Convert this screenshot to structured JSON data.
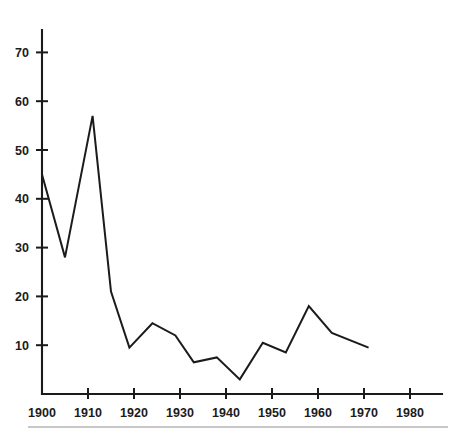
{
  "chart_data": {
    "type": "line",
    "title": "",
    "subtitle": "",
    "xlabel": "",
    "ylabel": "",
    "xlim": [
      1900,
      1980
    ],
    "ylim": [
      0,
      77
    ],
    "grid": false,
    "legend": null,
    "xticks": [
      "1900",
      "1910",
      "1920",
      "1930",
      "1940",
      "1950",
      "1960",
      "1970",
      "1980"
    ],
    "xtick_values": [
      1900,
      1910,
      1920,
      1930,
      1940,
      1950,
      1960,
      1970,
      1980
    ],
    "yticks": [
      "10",
      "20",
      "30",
      "40",
      "50",
      "60",
      "70"
    ],
    "ytick_values": [
      10,
      20,
      30,
      40,
      50,
      60,
      70
    ],
    "series": [
      {
        "name": "series-1",
        "color": "#1b1b1b",
        "x": [
          1900,
          1905,
          1911,
          1915,
          1919,
          1924,
          1929,
          1933,
          1938,
          1943,
          1948,
          1953,
          1958,
          1963,
          1971
        ],
        "values": [
          45,
          28,
          57,
          21,
          9.5,
          14.5,
          12,
          6.5,
          7.5,
          3,
          10.5,
          8.5,
          18,
          12.5,
          9.5
        ]
      }
    ],
    "annotations": []
  },
  "figure": {
    "axis_color": "#1b1b1b",
    "line_color": "#1b1b1b",
    "background": "#ffffff",
    "footer_rule_color": "#b4b4b4"
  }
}
